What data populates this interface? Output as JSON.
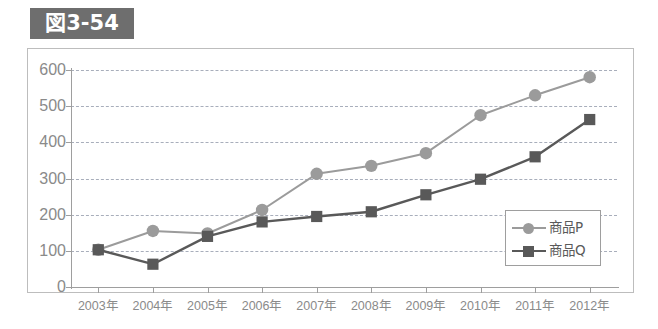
{
  "figure": {
    "badge_label": "図3-54",
    "badge_bg": "#6e6e6e",
    "badge_text_color": "#ffffff"
  },
  "colors": {
    "series_p": "#9b9b9b",
    "series_q": "#595959",
    "gridline": "#9aa0b0",
    "axis": "#9e9e9e",
    "tick_text": "#8a8a8a",
    "frame_border": "#bdbdbd",
    "legend_border": "#9e9e9e",
    "background": "#ffffff"
  },
  "chart_data": {
    "type": "line",
    "title": "図3-54",
    "xlabel": "",
    "ylabel": "",
    "categories": [
      "2003年",
      "2004年",
      "2005年",
      "2006年",
      "2007年",
      "2008年",
      "2009年",
      "2010年",
      "2011年",
      "2012年"
    ],
    "ylim": [
      0,
      600
    ],
    "yticks": [
      0,
      100,
      200,
      300,
      400,
      500,
      600
    ],
    "ytick_labels": [
      "0",
      "100",
      "200",
      "300",
      "400",
      "500",
      "600"
    ],
    "grid": true,
    "grid_style": "dashed-horizontal",
    "legend_position": "bottom-right",
    "series": [
      {
        "name": "商品P",
        "marker": "circle",
        "color": "#9b9b9b",
        "values": [
          103,
          155,
          148,
          213,
          313,
          335,
          370,
          475,
          530,
          580
        ]
      },
      {
        "name": "商品Q",
        "marker": "square",
        "color": "#595959",
        "values": [
          103,
          63,
          140,
          180,
          195,
          208,
          255,
          298,
          360,
          463
        ]
      }
    ]
  }
}
